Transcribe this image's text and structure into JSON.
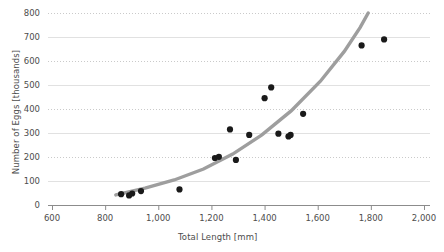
{
  "chart_data": {
    "type": "scatter",
    "title": "",
    "xlabel": "Total Length [mm]",
    "ylabel": "Number of Eggs [thousands]",
    "xlim": [
      600,
      2000
    ],
    "ylim": [
      0,
      800
    ],
    "xticks": [
      "600",
      "800",
      "1,000",
      "1,200",
      "1,400",
      "1,600",
      "1,800",
      "2,000"
    ],
    "xtick_values": [
      600,
      800,
      1000,
      1200,
      1400,
      1600,
      1800,
      2000
    ],
    "yticks": [
      "0",
      "100",
      "200",
      "300",
      "400",
      "500",
      "600",
      "700",
      "800"
    ],
    "ytick_values": [
      0,
      100,
      200,
      300,
      400,
      500,
      600,
      700,
      800
    ],
    "grid": true,
    "legend": "none",
    "marker_color": "#1a1a1a",
    "fit_color": "#9e9e9e",
    "points": [
      {
        "x": 860,
        "y": 45
      },
      {
        "x": 890,
        "y": 40
      },
      {
        "x": 902,
        "y": 48
      },
      {
        "x": 935,
        "y": 58
      },
      {
        "x": 1080,
        "y": 65
      },
      {
        "x": 1213,
        "y": 196
      },
      {
        "x": 1228,
        "y": 201
      },
      {
        "x": 1270,
        "y": 315
      },
      {
        "x": 1292,
        "y": 188
      },
      {
        "x": 1342,
        "y": 292
      },
      {
        "x": 1400,
        "y": 445
      },
      {
        "x": 1425,
        "y": 490
      },
      {
        "x": 1452,
        "y": 297
      },
      {
        "x": 1490,
        "y": 286
      },
      {
        "x": 1498,
        "y": 292
      },
      {
        "x": 1545,
        "y": 380
      },
      {
        "x": 1765,
        "y": 665
      },
      {
        "x": 1850,
        "y": 690
      }
    ],
    "fit_curve": {
      "label": "power-trend-line",
      "points": [
        {
          "x": 840,
          "y": 42
        },
        {
          "x": 950,
          "y": 70
        },
        {
          "x": 1060,
          "y": 104
        },
        {
          "x": 1170,
          "y": 150
        },
        {
          "x": 1280,
          "y": 212
        },
        {
          "x": 1390,
          "y": 292
        },
        {
          "x": 1500,
          "y": 392
        },
        {
          "x": 1610,
          "y": 516
        },
        {
          "x": 1700,
          "y": 640
        },
        {
          "x": 1760,
          "y": 740
        },
        {
          "x": 1790,
          "y": 800
        }
      ]
    }
  }
}
